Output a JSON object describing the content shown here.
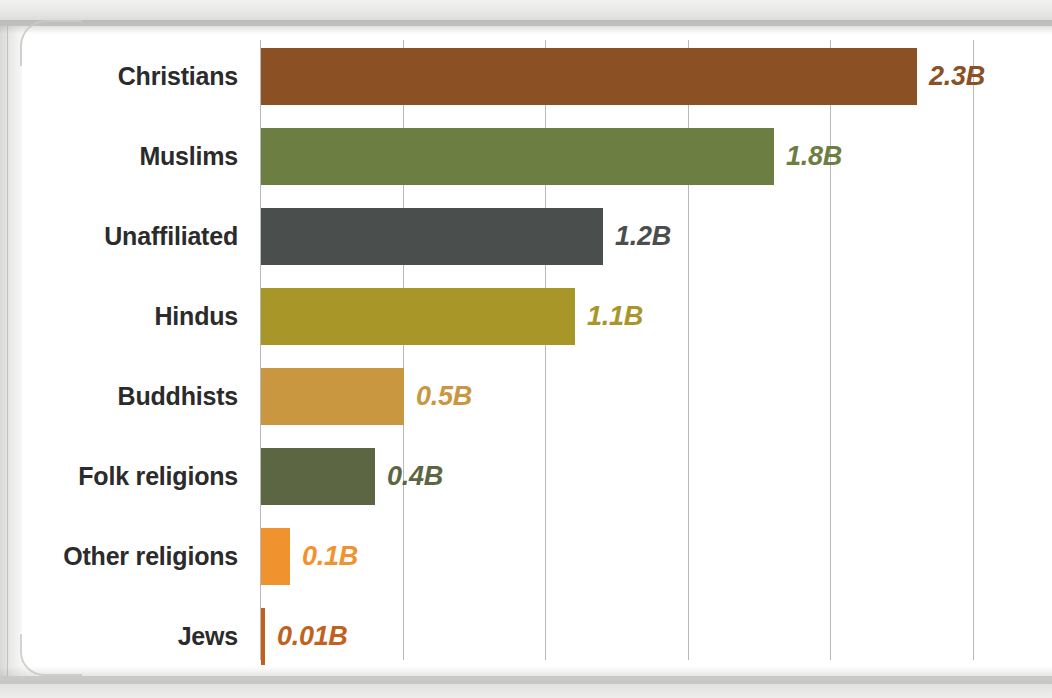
{
  "chart_data": {
    "type": "bar",
    "orientation": "horizontal",
    "title": "",
    "subtitle": "",
    "xlabel": "",
    "ylabel": "",
    "xlim": [
      0,
      2.5
    ],
    "grid": true,
    "gridlines": [
      0,
      0.5,
      1.0,
      1.5,
      2.0,
      2.5
    ],
    "legend": "none",
    "categories": [
      "Christians",
      "Muslims",
      "Unaffiliated",
      "Hindus",
      "Buddhists",
      "Folk religions",
      "Other religions",
      "Jews"
    ],
    "values": [
      2.3,
      1.8,
      1.2,
      1.1,
      0.5,
      0.4,
      0.1,
      0.01
    ],
    "value_labels": [
      "2.3B",
      "1.8B",
      "1.2B",
      "1.1B",
      "0.5B",
      "0.4B",
      "0.1B",
      "0.01B"
    ],
    "colors": [
      "#8B5024",
      "#6C7E42",
      "#4A4E4C",
      "#A89628",
      "#C8973F",
      "#5C6642",
      "#F0922E",
      "#C2601E"
    ],
    "label_colors": [
      "#8B5024",
      "#6C7E42",
      "#4A4E4C",
      "#A89628",
      "#C8973F",
      "#5C6642",
      "#F0922E",
      "#C2601E"
    ],
    "units": "billions of adherents",
    "category_label_color": "#2b2b2b"
  }
}
